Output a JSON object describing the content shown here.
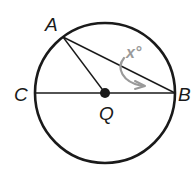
{
  "diagram": {
    "type": "circle-geometry",
    "colors": {
      "stroke": "#1a1a1a",
      "angle_marker": "#9a9a9a",
      "background": "#ffffff"
    },
    "circle": {
      "center": "Q",
      "cx": 105,
      "cy": 93,
      "r": 70
    },
    "points": {
      "A": {
        "label": "A",
        "x": 63,
        "y": 37
      },
      "B": {
        "label": "B",
        "x": 175,
        "y": 93
      },
      "C": {
        "label": "C",
        "x": 35,
        "y": 93
      },
      "Q": {
        "label": "Q",
        "x": 105,
        "y": 93
      }
    },
    "segments": [
      "CB",
      "AB",
      "AQ"
    ],
    "angle": {
      "vertex": "B",
      "between": [
        "A",
        "C"
      ],
      "label": "x°"
    }
  }
}
